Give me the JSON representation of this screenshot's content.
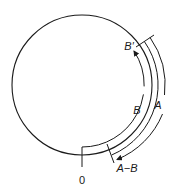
{
  "diagram": {
    "type": "circular-arc-subtraction",
    "stroke_color": "#1a1a1a",
    "background": "#ffffff",
    "labels": {
      "origin": "0",
      "b_prime": "B′",
      "b": "B",
      "a": "A",
      "a_minus_b": "A−B"
    }
  }
}
